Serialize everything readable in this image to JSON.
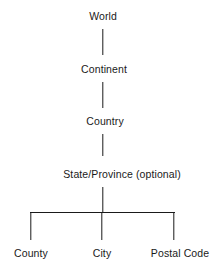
{
  "diagram": {
    "type": "hierarchy",
    "nodes": [
      {
        "id": "world",
        "label": "World",
        "level": 0
      },
      {
        "id": "continent",
        "label": "Continent",
        "level": 1,
        "parent": "world"
      },
      {
        "id": "country",
        "label": "Country",
        "level": 2,
        "parent": "continent"
      },
      {
        "id": "state",
        "label": "State/Province (optional)",
        "level": 3,
        "parent": "country"
      },
      {
        "id": "county",
        "label": "County",
        "level": 4,
        "parent": "state"
      },
      {
        "id": "city",
        "label": "City",
        "level": 4,
        "parent": "state"
      },
      {
        "id": "postal",
        "label": "Postal Code",
        "level": 4,
        "parent": "state"
      }
    ],
    "line_color": "#1a1a1a",
    "text_color": "#1a1a1a",
    "background": "#ffffff"
  }
}
